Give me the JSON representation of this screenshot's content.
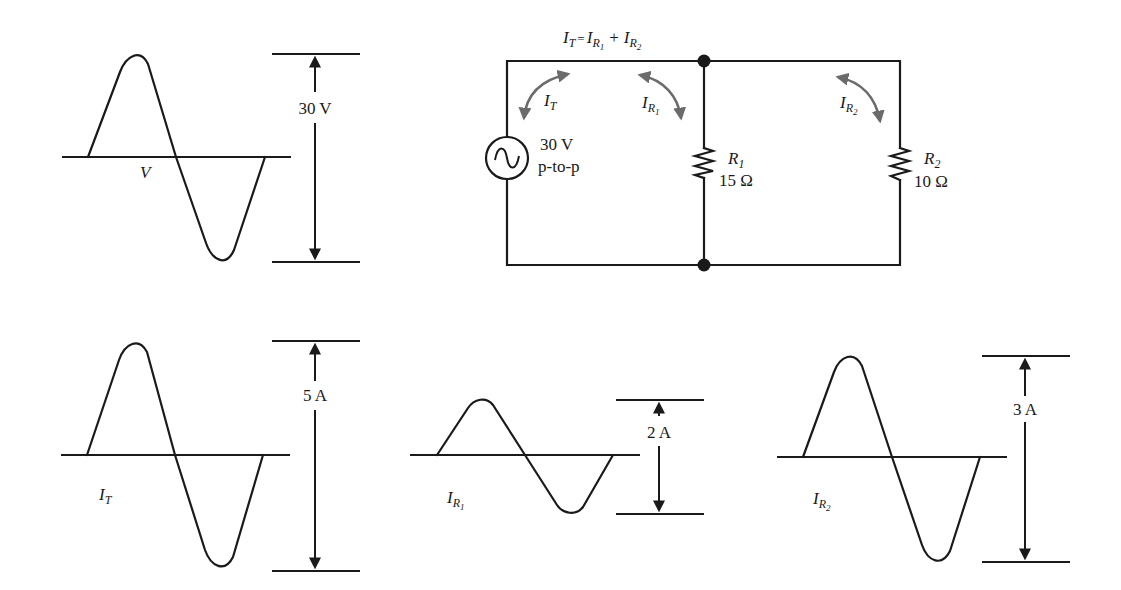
{
  "diagram": {
    "title_equation": {
      "lhs": "I",
      "lhs_sub": "T",
      "eq": "=",
      "t1": "I",
      "t1_sub": "R",
      "t1_subsub": "1",
      "plus": "+",
      "t2": "I",
      "t2_sub": "R",
      "t2_subsub": "2"
    },
    "source": {
      "value": "30 V",
      "note": "p-to-p",
      "symbol": "ac-source"
    },
    "resistors": [
      {
        "name": "R",
        "index": "1",
        "value": "15 Ω"
      },
      {
        "name": "R",
        "index": "2",
        "value": "10 Ω"
      }
    ],
    "current_arrows": [
      {
        "sym": "I",
        "sub": "T",
        "subsub": ""
      },
      {
        "sym": "I",
        "sub": "R",
        "subsub": "1"
      },
      {
        "sym": "I",
        "sub": "R",
        "subsub": "2"
      }
    ],
    "waveforms": [
      {
        "name": "V",
        "sym": "V",
        "sub": "",
        "subsub": "",
        "amplitude_label": "30 V"
      },
      {
        "name": "I_T",
        "sym": "I",
        "sub": "T",
        "subsub": "",
        "amplitude_label": "5 A"
      },
      {
        "name": "I_R1",
        "sym": "I",
        "sub": "R",
        "subsub": "1",
        "amplitude_label": "2 A"
      },
      {
        "name": "I_R2",
        "sym": "I",
        "sub": "R",
        "subsub": "2",
        "amplitude_label": "3 A"
      }
    ],
    "colors": {
      "line": "#1a1a1a",
      "current_arrow": "#6b6b6b",
      "background": "#ffffff"
    }
  }
}
